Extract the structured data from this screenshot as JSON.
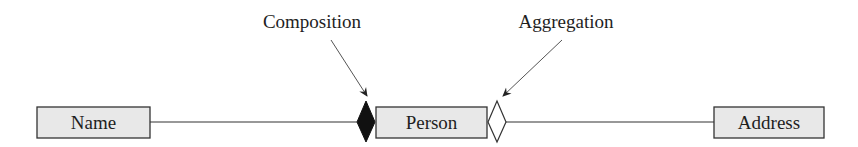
{
  "diagram": {
    "type": "UML class relationship",
    "classes": [
      {
        "id": "name",
        "label": "Name"
      },
      {
        "id": "person",
        "label": "Person"
      },
      {
        "id": "address",
        "label": "Address"
      }
    ],
    "relationships": [
      {
        "from": "name",
        "to": "person",
        "kind": "composition",
        "marker": "filled-diamond",
        "marker_at": "person"
      },
      {
        "from": "address",
        "to": "person",
        "kind": "aggregation",
        "marker": "hollow-diamond",
        "marker_at": "person"
      }
    ],
    "annotations": [
      {
        "id": "composition",
        "label": "Composition",
        "points_to": "filled-diamond"
      },
      {
        "id": "aggregation",
        "label": "Aggregation",
        "points_to": "hollow-diamond"
      }
    ],
    "colors": {
      "box_fill": "#e8e8e8",
      "stroke": "#333333",
      "filled_diamond": "#111111",
      "text": "#1e1e1e"
    }
  }
}
